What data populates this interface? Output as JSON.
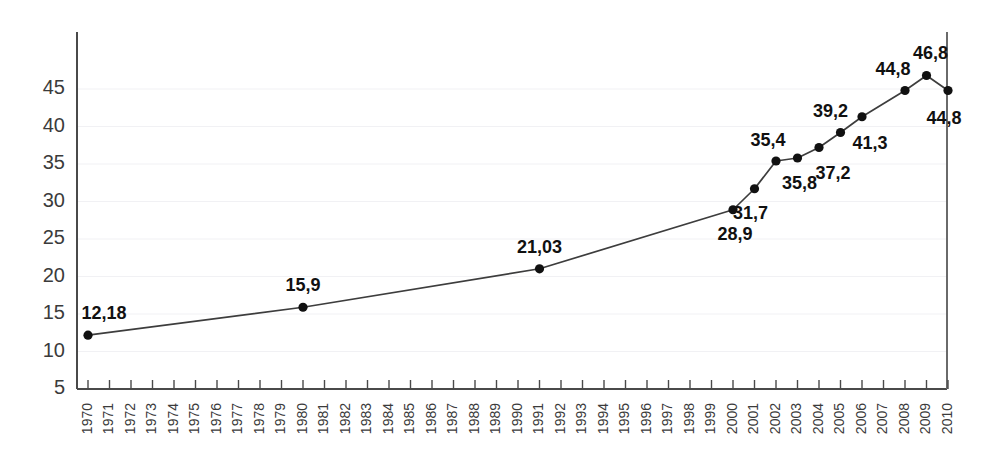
{
  "chart_data": {
    "type": "line",
    "title": "",
    "subtitle": "",
    "xlabel": "",
    "ylabel": "",
    "grid": true,
    "legend": "none",
    "decimal_separator": ",",
    "xlim": [
      1970,
      2010
    ],
    "ylim": [
      5,
      47.5
    ],
    "ytick_labels": [
      "5",
      "10",
      "15",
      "20",
      "25",
      "30",
      "35",
      "40",
      "45"
    ],
    "yticks": [
      5,
      10,
      15,
      20,
      25,
      30,
      35,
      40,
      45
    ],
    "xtick_labels": [
      "1970",
      "1971",
      "1972",
      "1973",
      "1974",
      "1975",
      "1976",
      "1977",
      "1978",
      "1979",
      "1980",
      "1981",
      "1982",
      "1983",
      "1984",
      "1985",
      "1986",
      "1987",
      "1988",
      "1989",
      "1990",
      "1991",
      "1992",
      "1993",
      "1994",
      "1995",
      "1996",
      "1997",
      "1998",
      "1999",
      "2000",
      "2001",
      "2002",
      "2003",
      "2004",
      "2005",
      "2006",
      "2007",
      "2008",
      "2009",
      "2010"
    ],
    "series": [
      {
        "name": "series-1",
        "color": "#3d3d3d",
        "points": [
          {
            "x": 1970,
            "y": 12.18,
            "label": "12,18",
            "label_dx": 16,
            "label_dy": -16
          },
          {
            "x": 1980,
            "y": 15.9,
            "label": "15,9",
            "label_dx": 0,
            "label_dy": -16
          },
          {
            "x": 1991,
            "y": 21.03,
            "label": "21,03",
            "label_dx": 0,
            "label_dy": -16
          },
          {
            "x": 2000,
            "y": 28.9,
            "label": "28,9",
            "label_dx": 2,
            "label_dy": 30
          },
          {
            "x": 2001,
            "y": 31.7,
            "label": "31,7",
            "label_dx": -4,
            "label_dy": 30
          },
          {
            "x": 2002,
            "y": 35.4,
            "label": "35,4",
            "label_dx": -8,
            "label_dy": -15
          },
          {
            "x": 2003,
            "y": 35.8,
            "label": "35,8",
            "label_dx": 2,
            "label_dy": 31
          },
          {
            "x": 2004,
            "y": 37.2,
            "label": "37,2",
            "label_dx": 14,
            "label_dy": 31
          },
          {
            "x": 2005,
            "y": 39.2,
            "label": "39,2",
            "label_dx": -10,
            "label_dy": -16
          },
          {
            "x": 2006,
            "y": 41.3,
            "label": "41,3",
            "label_dx": 8,
            "label_dy": 32
          },
          {
            "x": 2008,
            "y": 44.8,
            "label": "44,8",
            "label_dx": -12,
            "label_dy": -16
          },
          {
            "x": 2009,
            "y": 46.8,
            "label": "46,8",
            "label_dx": 4,
            "label_dy": -17
          },
          {
            "x": 2010,
            "y": 44.8,
            "label": "44,8",
            "label_dx": -4,
            "label_dy": 33
          }
        ]
      }
    ],
    "colors": {
      "line": "#3d3d3d",
      "marker": "#111111",
      "axis": "#4a4a4a",
      "grid": "#f1f1f4",
      "tick_text": "#3b3b3b",
      "label_text": "#111111",
      "background": "#ffffff"
    }
  },
  "geometry": {
    "plot_left": 77,
    "plot_right": 947,
    "plot_top": 32,
    "plot_bottom": 389,
    "y_value_at_bottom": 5,
    "y_value_at_top": 52.6,
    "x_first_tick": 88,
    "x_tick_step": 21.5
  }
}
